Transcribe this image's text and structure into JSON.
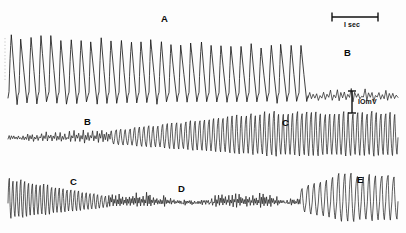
{
  "figure": {
    "kind": "electrophysiology-recording",
    "background_color": "#fdfdfd",
    "trace_color": "#111111",
    "strip_count": 3
  },
  "scalebars": {
    "time": {
      "label": "I sec",
      "x_start": 332,
      "x_end": 378,
      "y": 17,
      "tick_height": 9
    },
    "voltage": {
      "label": "IOmV",
      "x": 352,
      "y_top": 91,
      "y_bottom": 113,
      "cap_width": 8
    }
  },
  "phase_labels": [
    {
      "text": "A",
      "x": 161,
      "y": 14,
      "strip": 1
    },
    {
      "text": "B",
      "x": 344,
      "y": 48,
      "strip": 1
    },
    {
      "text": "B",
      "x": 84,
      "y": 117,
      "strip": 2
    },
    {
      "text": "C",
      "x": 282,
      "y": 118,
      "strip": 2
    },
    {
      "text": "C",
      "x": 70,
      "y": 177,
      "strip": 3
    },
    {
      "text": "D",
      "x": 178,
      "y": 184,
      "strip": 3
    },
    {
      "text": "E",
      "x": 357,
      "y": 175,
      "strip": 3
    }
  ],
  "chart_data": {
    "type": "line",
    "title": "",
    "xlabel": "time",
    "ylabel": "membrane potential",
    "units": {
      "time": "sec",
      "amplitude": "mV"
    },
    "scale": {
      "time_bar_seconds": 1,
      "voltage_bar_mv": 10
    },
    "grid": false,
    "legend": false,
    "series": [
      {
        "name": "strip-1",
        "phases": [
          "A",
          "B"
        ],
        "x_range": [
          8,
          398
        ],
        "baseline_y": 98,
        "segments": [
          {
            "phase": "A",
            "label": "A",
            "x_start": 8,
            "x_end": 308,
            "waveform": "spike-train",
            "cycles": 30,
            "amplitude": 62,
            "amplitude_trend": "slightly-decreasing",
            "description": "large fast rising sharp spikes with slow decay, leaning right"
          },
          {
            "phase": "B",
            "label": "B",
            "x_start": 308,
            "x_end": 398,
            "waveform": "low-amplitude-irregular",
            "cycles": 13,
            "amplitude": 7,
            "amplitude_trend": "flat",
            "description": "abrupt collapse to small irregular ripples"
          }
        ]
      },
      {
        "name": "strip-2",
        "phases": [
          "B",
          "C"
        ],
        "x_range": [
          8,
          398
        ],
        "baseline_y": 139,
        "segments": [
          {
            "phase": "B",
            "label": "B",
            "x_start": 8,
            "x_end": 110,
            "waveform": "low-amplitude-irregular",
            "cycles": 22,
            "amplitude": 8,
            "amplitude_trend": "increasing",
            "description": "small noisy oscillation slowly building"
          },
          {
            "phase": "C",
            "label": "C",
            "x_start": 110,
            "x_end": 398,
            "waveform": "regular-oscillation",
            "cycles": 62,
            "amplitude": 26,
            "amplitude_trend": "increasing-then-plateau",
            "description": "dense regular oscillations growing to full amplitude"
          }
        ]
      },
      {
        "name": "strip-3",
        "phases": [
          "C",
          "D",
          "E"
        ],
        "x_range": [
          8,
          398
        ],
        "baseline_y": 203,
        "segments": [
          {
            "phase": "C",
            "label": "C",
            "x_start": 8,
            "x_end": 108,
            "waveform": "regular-oscillation",
            "cycles": 26,
            "amplitude": 24,
            "amplitude_trend": "decreasing",
            "description": "full amplitude oscillation decaying"
          },
          {
            "phase": "D",
            "label": "D",
            "x_start": 108,
            "x_end": 300,
            "waveform": "low-amplitude-irregular",
            "cycles": 56,
            "amplitude": 7,
            "amplitude_trend": "flat-noisy",
            "description": "depressed irregular low amplitude activity"
          },
          {
            "phase": "E",
            "label": "E",
            "x_start": 300,
            "x_end": 398,
            "waveform": "large-slow-oscillation",
            "cycles": 16,
            "amplitude": 28,
            "amplitude_trend": "abrupt-increase",
            "description": "sudden recovery to large slower oscillations"
          }
        ]
      }
    ]
  }
}
